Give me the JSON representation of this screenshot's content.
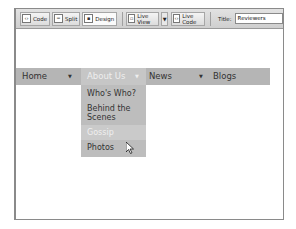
{
  "toolbar": {
    "buttons": [
      {
        "label": "Code",
        "icon": "code-view-icon"
      },
      {
        "label": "Split",
        "icon": "split-view-icon"
      },
      {
        "label": "Design",
        "icon": "design-view-icon"
      },
      {
        "label": "Live View",
        "icon": "live-view-icon"
      },
      {
        "label": "Live Code",
        "icon": "live-code-icon"
      }
    ],
    "title_label": "Title:",
    "title_value": "Reviewers"
  },
  "nav": {
    "items": [
      {
        "label": "Home",
        "arrow": "▼"
      },
      {
        "label": "About Us",
        "arrow": "▼"
      },
      {
        "label": "News",
        "arrow": "▼"
      },
      {
        "label": "Blogs",
        "arrow": ""
      }
    ]
  },
  "submenu": {
    "items": [
      {
        "label": "Who's Who?"
      },
      {
        "label": "Behind the Scenes"
      },
      {
        "label": "Gossip"
      },
      {
        "label": "Photos"
      }
    ]
  }
}
